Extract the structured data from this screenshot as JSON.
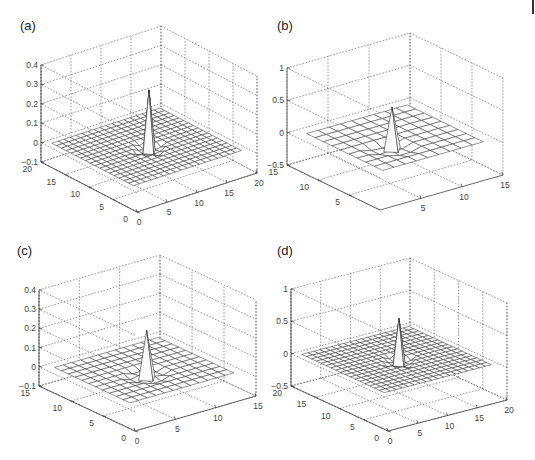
{
  "figure": {
    "panels": [
      {
        "id": "a",
        "label": "(a)"
      },
      {
        "id": "b",
        "label": "(b)"
      },
      {
        "id": "c",
        "label": "(c)"
      },
      {
        "id": "d",
        "label": "(d)"
      }
    ]
  },
  "chart_data": [
    {
      "panel": "(a)",
      "type": "surface-mesh-3d",
      "title": "",
      "description": "Central spike (sinc-like 2D kernel) on a flat grid with a small negative ring",
      "x_ticks": [
        0,
        5,
        10,
        15,
        20
      ],
      "y_ticks": [
        0,
        5,
        10,
        15,
        20
      ],
      "z_ticks": [
        -0.1,
        0,
        0.1,
        0.2,
        0.3,
        0.4
      ],
      "z_tick_labels": [
        "−0.1",
        "0",
        "0.1",
        "0.2",
        "0.3",
        "0.4"
      ],
      "xlim": [
        0,
        20
      ],
      "ylim": [
        0,
        20
      ],
      "zlim": [
        -0.1,
        0.4
      ],
      "grid_size": 21,
      "peak": {
        "x": 10,
        "y": 10,
        "z": 0.3
      },
      "grid": true
    },
    {
      "panel": "(b)",
      "type": "surface-mesh-3d",
      "title": "",
      "description": "Narrow central spike on a flat grid",
      "x_ticks": [
        5,
        10,
        15
      ],
      "y_ticks": [
        5,
        10,
        15
      ],
      "z_ticks": [
        -0.5,
        0,
        0.5,
        1
      ],
      "z_tick_labels": [
        "−0.5",
        "0",
        "0.5",
        "1"
      ],
      "xlim": [
        0,
        15
      ],
      "ylim": [
        0,
        15
      ],
      "zlim": [
        -0.5,
        1
      ],
      "grid_size": 12,
      "peak": {
        "x": 6,
        "y": 6,
        "z": 0.6
      },
      "grid": true
    },
    {
      "panel": "(c)",
      "type": "surface-mesh-3d",
      "title": "",
      "description": "Central spike with side lobes on a flat grid",
      "x_ticks": [
        0,
        5,
        10,
        15
      ],
      "y_ticks": [
        0,
        5,
        10,
        15
      ],
      "z_ticks": [
        -0.1,
        0,
        0.1,
        0.2,
        0.3,
        0.4
      ],
      "z_tick_labels": [
        "−0.1",
        "0",
        "0.1",
        "0.2",
        "0.3",
        "0.4"
      ],
      "xlim": [
        0,
        15
      ],
      "ylim": [
        0,
        15
      ],
      "zlim": [
        -0.1,
        0.4
      ],
      "grid_size": 15,
      "peak": {
        "x": 7,
        "y": 7,
        "z": 0.23
      },
      "grid": true
    },
    {
      "panel": "(d)",
      "type": "surface-mesh-3d",
      "title": "",
      "description": "Narrow central spike on a fine flat grid",
      "x_ticks": [
        0,
        5,
        10,
        15,
        20
      ],
      "y_ticks": [
        0,
        5,
        10,
        15,
        20
      ],
      "z_ticks": [
        -0.5,
        0,
        0.5,
        1
      ],
      "z_tick_labels": [
        "−0.5",
        "0",
        "0.5",
        "1"
      ],
      "xlim": [
        0,
        20
      ],
      "ylim": [
        0,
        20
      ],
      "zlim": [
        -0.5,
        1
      ],
      "grid_size": 21,
      "peak": {
        "x": 10,
        "y": 10,
        "z": 0.65
      },
      "grid": true
    }
  ]
}
